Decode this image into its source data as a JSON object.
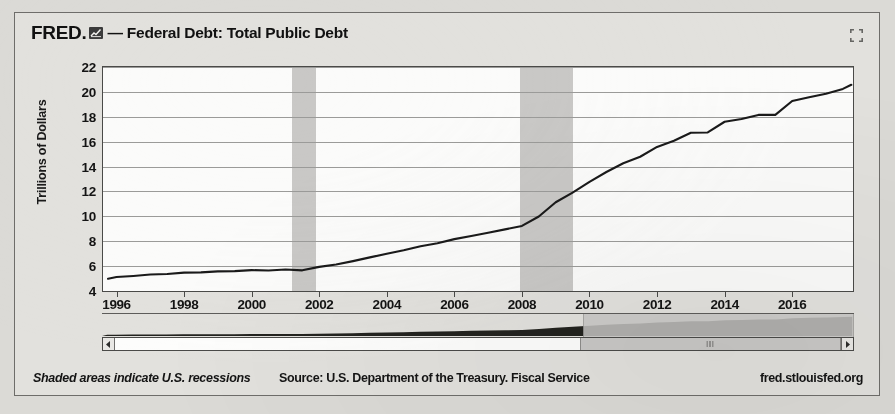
{
  "header": {
    "brand": "FRED.",
    "logo_icon": "fred-chart-logo-icon",
    "separator": "— ",
    "title": "Federal Debt: Total Public Debt",
    "expand_icon": "expand-fullscreen-icon"
  },
  "footer": {
    "note": "Shaded areas indicate U.S. recessions",
    "source": "Source: U.S. Department of the Treasury. Fiscal Service",
    "url": "fred.stlouisfed.org"
  },
  "controls": {
    "scrollbar": {
      "left_arrow_icon": "arrow-left-icon",
      "right_arrow_icon": "arrow-right-icon",
      "grip_icon": "scroll-thumb-grip-icon",
      "thumb_start_pct": 64,
      "thumb_end_pct": 100
    }
  },
  "colors": {
    "card_bg": "#e2e1dd",
    "page_bg": "#dbdad6",
    "plot_bg": "#fbfbfa",
    "line": "#1a1a1a",
    "recession_band": "#c9c8c6",
    "gridline": "#9b9b99",
    "axis": "#4a4a48",
    "text": "#141414"
  },
  "chart_data": {
    "type": "line",
    "title": "Federal Debt: Total Public Debt",
    "subtitle": "",
    "xlabel": "",
    "ylabel": "Trillions of Dollars",
    "xlim": [
      1995.6,
      2017.8
    ],
    "ylim": [
      4,
      22
    ],
    "yticks": [
      4,
      6,
      8,
      10,
      12,
      14,
      16,
      18,
      20,
      22
    ],
    "xticks": [
      1996,
      1998,
      2000,
      2002,
      2004,
      2006,
      2008,
      2010,
      2012,
      2014,
      2016
    ],
    "grid": true,
    "legend": null,
    "annotations": [
      "Shaded areas indicate U.S. recessions"
    ],
    "shaded_regions": [
      {
        "label": "2001 recession",
        "x0": 2001.2,
        "x1": 2001.9
      },
      {
        "label": "2007-2009 recession",
        "x0": 2007.95,
        "x1": 2009.5
      }
    ],
    "series": [
      {
        "name": "Federal Debt: Total Public Debt",
        "units": "Trillions of Dollars",
        "x": [
          1995.75,
          1996.0,
          1996.5,
          1997.0,
          1997.5,
          1998.0,
          1998.5,
          1999.0,
          1999.5,
          2000.0,
          2000.5,
          2001.0,
          2001.5,
          2002.0,
          2002.5,
          2003.0,
          2003.5,
          2004.0,
          2004.5,
          2005.0,
          2005.5,
          2006.0,
          2006.5,
          2007.0,
          2007.5,
          2008.0,
          2008.5,
          2009.0,
          2009.5,
          2010.0,
          2010.5,
          2011.0,
          2011.5,
          2012.0,
          2012.5,
          2013.0,
          2013.5,
          2014.0,
          2014.5,
          2015.0,
          2015.5,
          2016.0,
          2016.5,
          2017.0,
          2017.5,
          2017.75
        ],
        "y": [
          4.99,
          5.12,
          5.21,
          5.32,
          5.37,
          5.48,
          5.5,
          5.58,
          5.6,
          5.68,
          5.65,
          5.73,
          5.66,
          5.94,
          6.13,
          6.4,
          6.7,
          7.0,
          7.27,
          7.6,
          7.84,
          8.17,
          8.42,
          8.68,
          8.95,
          9.23,
          9.99,
          11.13,
          11.91,
          12.77,
          13.56,
          14.27,
          14.79,
          15.58,
          16.07,
          16.72,
          16.74,
          17.6,
          17.82,
          18.15,
          18.15,
          19.27,
          19.57,
          19.85,
          20.24,
          20.57
        ]
      }
    ]
  }
}
